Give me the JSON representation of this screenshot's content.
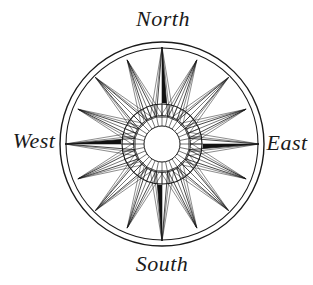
{
  "figure": {
    "type": "compass-rose",
    "points_total": 16,
    "cardinal_points_filled": 4,
    "labels": {
      "north": "North",
      "east": "East",
      "south": "South",
      "west": "West"
    },
    "colors": {
      "line": "#1a1a1a",
      "point_fill": "#111111",
      "background": "#ffffff"
    }
  }
}
